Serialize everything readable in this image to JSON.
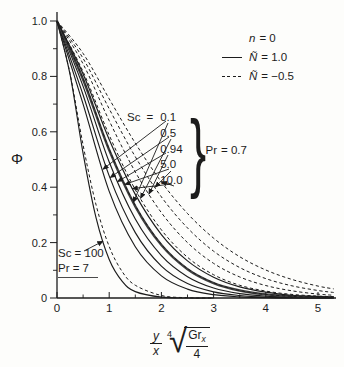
{
  "figure": {
    "background": "#fdfdfb",
    "ink": "#1c1c1c"
  },
  "axes": {
    "x": {
      "min": 0,
      "max": 5.35,
      "major_ticks": [
        0,
        1,
        2,
        3,
        4,
        5
      ],
      "tick_labels": [
        "0",
        "1",
        "2",
        "3",
        "4",
        "5"
      ],
      "minor_ticks": [
        0.5,
        1.5,
        2.5,
        3.5,
        4.5
      ]
    },
    "y": {
      "min": 0,
      "max": 1.0,
      "major_ticks": [
        0,
        0.2,
        0.4,
        0.6,
        0.8,
        1.0
      ],
      "tick_labels": [
        "0",
        "0.2",
        "0.4",
        "0.6",
        "0.8",
        "1.0"
      ],
      "minor_ticks": [
        0.1,
        0.3,
        0.5,
        0.7,
        0.9
      ]
    }
  },
  "chart_data": {
    "type": "line",
    "title": "",
    "xlabel": "(y/x)·(Gr_x/4)^(1/4)",
    "ylabel": "Φ",
    "xlim": [
      0,
      5.35
    ],
    "ylim": [
      0,
      1.0
    ],
    "grid": false,
    "legend_position": "top-right",
    "series": [
      {
        "id": "solid-Sc0.1",
        "Sc": "0.1",
        "Pr": "0.7",
        "N": "1.0",
        "style": "solid",
        "width": 1.15,
        "points": [
          [
            0,
            1
          ],
          [
            0.5,
            0.7
          ],
          [
            1,
            0.385
          ],
          [
            1.5,
            0.185
          ],
          [
            2,
            0.08
          ],
          [
            2.5,
            0.032
          ],
          [
            3,
            0.012
          ],
          [
            3.5,
            0.004
          ],
          [
            4,
            0.001
          ],
          [
            4.5,
            0
          ],
          [
            5,
            0
          ],
          [
            5.3,
            0
          ]
        ]
      },
      {
        "id": "solid-Sc0.5",
        "Sc": "0.5",
        "Pr": "0.7",
        "N": "1.0",
        "style": "solid",
        "width": 1.15,
        "points": [
          [
            0,
            1
          ],
          [
            0.5,
            0.733
          ],
          [
            1,
            0.441
          ],
          [
            1.5,
            0.236
          ],
          [
            2,
            0.115
          ],
          [
            2.5,
            0.052
          ],
          [
            3,
            0.022
          ],
          [
            3.5,
            0.009
          ],
          [
            4,
            0.003
          ],
          [
            4.5,
            0.001
          ],
          [
            5,
            0
          ],
          [
            5.3,
            0
          ]
        ]
      },
      {
        "id": "solid-Sc0.94",
        "Sc": "0.94",
        "Pr": "0.7",
        "N": "1.0",
        "style": "solid",
        "width": 1.15,
        "points": [
          [
            0,
            1
          ],
          [
            0.5,
            0.764
          ],
          [
            1,
            0.491
          ],
          [
            1.5,
            0.285
          ],
          [
            2,
            0.153
          ],
          [
            2.5,
            0.077
          ],
          [
            3,
            0.036
          ],
          [
            3.5,
            0.016
          ],
          [
            4,
            0.007
          ],
          [
            4.5,
            0.003
          ],
          [
            5,
            0.001
          ],
          [
            5.3,
            0.001
          ]
        ]
      },
      {
        "id": "solid-Sc5.0",
        "Sc": "5.0",
        "Pr": "0.7",
        "N": "1.0",
        "style": "solid",
        "width": 2.4,
        "points": [
          [
            0,
            1
          ],
          [
            0.5,
            0.789
          ],
          [
            1,
            0.534
          ],
          [
            1.5,
            0.331
          ],
          [
            2,
            0.191
          ],
          [
            2.5,
            0.104
          ],
          [
            3,
            0.054
          ],
          [
            3.5,
            0.027
          ],
          [
            4,
            0.013
          ],
          [
            4.5,
            0.006
          ],
          [
            5,
            0.003
          ],
          [
            5.3,
            0.002
          ]
        ]
      },
      {
        "id": "solid-Sc10",
        "Sc": "10.0",
        "Pr": "0.7",
        "N": "1.0",
        "style": "solid",
        "width": 1.15,
        "points": [
          [
            0,
            1
          ],
          [
            0.5,
            0.809
          ],
          [
            1,
            0.572
          ],
          [
            1.5,
            0.374
          ],
          [
            2,
            0.229
          ],
          [
            2.5,
            0.134
          ],
          [
            3,
            0.075
          ],
          [
            3.5,
            0.04
          ],
          [
            4,
            0.021
          ],
          [
            4.5,
            0.01
          ],
          [
            5,
            0.005
          ],
          [
            5.3,
            0.003
          ]
        ]
      },
      {
        "id": "dashed-Sc0.1",
        "Sc": "0.1",
        "Pr": "0.7",
        "N": "-0.5",
        "style": "dashed",
        "width": 1.0,
        "points": [
          [
            0,
            1
          ],
          [
            0.5,
            0.792
          ],
          [
            1,
            0.537
          ],
          [
            1.5,
            0.334
          ],
          [
            2,
            0.194
          ],
          [
            2.5,
            0.106
          ],
          [
            3,
            0.055
          ],
          [
            3.5,
            0.027
          ],
          [
            4,
            0.013
          ],
          [
            4.5,
            0.006
          ],
          [
            5,
            0.003
          ],
          [
            5.3,
            0.002
          ]
        ]
      },
      {
        "id": "dashed-Sc0.5",
        "Sc": "0.5",
        "Pr": "0.7",
        "N": "-0.5",
        "style": "dashed",
        "width": 1.0,
        "points": [
          [
            0,
            1
          ],
          [
            0.5,
            0.817
          ],
          [
            1,
            0.588
          ],
          [
            1.5,
            0.391
          ],
          [
            2,
            0.246
          ],
          [
            2.5,
            0.147
          ],
          [
            3,
            0.084
          ],
          [
            3.5,
            0.046
          ],
          [
            4,
            0.025
          ],
          [
            4.5,
            0.013
          ],
          [
            5,
            0.007
          ],
          [
            5.3,
            0.005
          ]
        ]
      },
      {
        "id": "dashed-Sc0.94",
        "Sc": "0.94",
        "Pr": "0.7",
        "N": "-0.5",
        "style": "dashed",
        "width": 1.0,
        "points": [
          [
            0,
            1
          ],
          [
            0.5,
            0.845
          ],
          [
            1,
            0.64
          ],
          [
            1.5,
            0.455
          ],
          [
            2,
            0.308
          ],
          [
            2.5,
            0.2
          ],
          [
            3,
            0.125
          ],
          [
            3.5,
            0.076
          ],
          [
            4,
            0.045
          ],
          [
            4.5,
            0.026
          ],
          [
            5,
            0.014
          ],
          [
            5.3,
            0.01
          ]
        ]
      },
      {
        "id": "dashed-Sc5.0",
        "Sc": "5.0",
        "Pr": "0.7",
        "N": "-0.5",
        "style": "dashed",
        "width": 1.0,
        "points": [
          [
            0,
            1
          ],
          [
            0.5,
            0.865
          ],
          [
            1,
            0.683
          ],
          [
            1.5,
            0.51
          ],
          [
            2,
            0.365
          ],
          [
            2.5,
            0.253
          ],
          [
            3,
            0.169
          ],
          [
            3.5,
            0.11
          ],
          [
            4,
            0.07
          ],
          [
            4.5,
            0.044
          ],
          [
            5,
            0.027
          ],
          [
            5.3,
            0.02
          ]
        ]
      },
      {
        "id": "dashed-Sc10",
        "Sc": "10.0",
        "Pr": "0.7",
        "N": "-0.5",
        "style": "dashed",
        "width": 1.0,
        "points": [
          [
            0,
            1
          ],
          [
            0.5,
            0.883
          ],
          [
            1,
            0.719
          ],
          [
            1.5,
            0.559
          ],
          [
            2,
            0.419
          ],
          [
            2.5,
            0.305
          ],
          [
            3,
            0.216
          ],
          [
            3.5,
            0.149
          ],
          [
            4,
            0.101
          ],
          [
            4.5,
            0.067
          ],
          [
            5,
            0.043
          ],
          [
            5.3,
            0.033
          ]
        ]
      },
      {
        "id": "solid-Sc100",
        "Sc": "100",
        "Pr": "7",
        "N": "1.0",
        "style": "solid",
        "width": 1.15,
        "points": [
          [
            0,
            1
          ],
          [
            0.25,
            0.807
          ],
          [
            0.5,
            0.522
          ],
          [
            0.75,
            0.288
          ],
          [
            1,
            0.139
          ],
          [
            1.25,
            0.06
          ],
          [
            1.5,
            0.023
          ],
          [
            2,
            0.003
          ],
          [
            2.5,
            0
          ],
          [
            3,
            0
          ]
        ]
      },
      {
        "id": "dashed-Sc100",
        "Sc": "100",
        "Pr": "7",
        "N": "-0.5",
        "style": "dashed",
        "width": 1.0,
        "points": [
          [
            0,
            1
          ],
          [
            0.25,
            0.81
          ],
          [
            0.5,
            0.552
          ],
          [
            0.75,
            0.335
          ],
          [
            1,
            0.186
          ],
          [
            1.25,
            0.095
          ],
          [
            1.5,
            0.046
          ],
          [
            2,
            0.009
          ],
          [
            2.5,
            0.001
          ],
          [
            3,
            0
          ]
        ]
      }
    ],
    "annotations": {
      "arrows": [
        {
          "from_px": [
            166,
            121
          ],
          "to": [
            0.88,
            0.465
          ]
        },
        {
          "from_px": [
            169,
            137
          ],
          "to": [
            1.02,
            0.435
          ]
        },
        {
          "from_px": [
            166,
            153
          ],
          "to": [
            1.16,
            0.42
          ]
        },
        {
          "from_px": [
            169,
            169
          ],
          "to": [
            1.3,
            0.41
          ]
        },
        {
          "from_px": [
            172,
            184
          ],
          "to": [
            1.44,
            0.395
          ]
        },
        {
          "from_px": [
            168,
            123
          ],
          "to": [
            1.46,
            0.345
          ]
        },
        {
          "from_px": [
            171,
            139
          ],
          "to": [
            1.6,
            0.36
          ]
        },
        {
          "from_px": [
            168,
            155
          ],
          "to": [
            1.76,
            0.375
          ]
        },
        {
          "from_px": [
            171,
            171
          ],
          "to": [
            1.88,
            0.4
          ]
        },
        {
          "from_px": [
            174,
            186
          ],
          "to": [
            2.0,
            0.42
          ]
        },
        {
          "from_px": [
            84,
            251
          ],
          "to": [
            0.88,
            0.205
          ]
        }
      ]
    }
  },
  "legend": {
    "rows": [
      {
        "swatch": "none",
        "sym": "n",
        "rest": "= 0"
      },
      {
        "swatch": "solid",
        "sym": "Ñ",
        "rest": "= 1.0"
      },
      {
        "swatch": "dashed",
        "sym": "Ñ",
        "rest": "= −0.5"
      }
    ]
  },
  "sc_block": {
    "label": "Sc",
    "eq": "=",
    "values": [
      "0.1",
      "0.5",
      "0.94",
      "5.0",
      "10.0"
    ],
    "brace": "}",
    "pr_sym": "Pr",
    "pr_rest": "= 0.7"
  },
  "sc100_block": {
    "line1": "Sc = 100",
    "line2": "Pr = 7"
  },
  "xlabel_parts": {
    "num": "y",
    "den": "x",
    "idx": "4",
    "sqrt": "√",
    "base": "Gr",
    "base_sub": "x",
    "rad_den": "4"
  }
}
